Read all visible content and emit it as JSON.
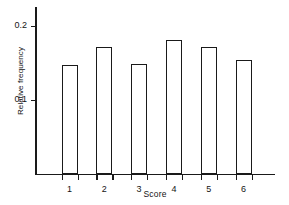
{
  "chart_data": {
    "type": "bar",
    "title": "",
    "xlabel": "Score",
    "ylabel": "Relative frequency",
    "categories": [
      "1",
      "2",
      "3",
      "4",
      "5",
      "6"
    ],
    "values": [
      0.147,
      0.171,
      0.148,
      0.181,
      0.171,
      0.153
    ],
    "ylim": [
      0,
      0.225
    ],
    "ytick_values": [
      0.1,
      0.2
    ],
    "ytick_labels": [
      "0.1",
      "0.2"
    ],
    "grid": false,
    "legend": "none",
    "bar_fill_color": "#ffffff",
    "bar_edge_color": "#1a1a1a",
    "axis_color": "#1a1a1a",
    "background_color": "#ffffff"
  }
}
